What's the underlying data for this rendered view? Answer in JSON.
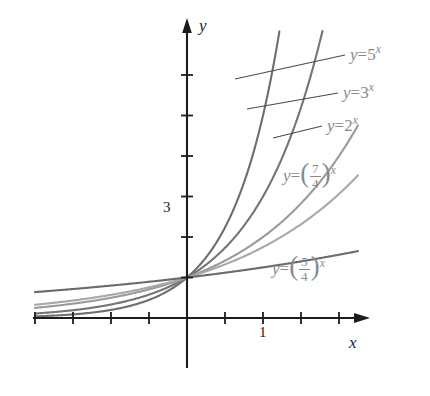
{
  "chart_data": {
    "type": "line",
    "title": "",
    "xlabel": "x",
    "ylabel": "y",
    "xlim": [
      -2.0,
      2.35
    ],
    "ylim": [
      -0.45,
      7.3
    ],
    "grid": false,
    "legend_position": "inline-labels",
    "x_tick_labels": [
      {
        "value": 1,
        "text": "1"
      }
    ],
    "y_tick_labels": [
      {
        "value": 3,
        "text": "3"
      }
    ],
    "x_ticks": [
      -2.0,
      -1.5,
      -1.0,
      -0.5,
      0,
      0.5,
      1.0,
      1.5,
      2.0
    ],
    "y_ticks": [
      0,
      1,
      2,
      3,
      4,
      5,
      6
    ],
    "note_common_point": "all curves pass through (0, 1)",
    "series": [
      {
        "name": "y = 5^x",
        "label_text": "y = 5",
        "base": 5,
        "color": "#6e6e6e",
        "points_x": [
          -2.0,
          -1.5,
          -1.0,
          -0.5,
          0,
          0.25,
          0.5,
          0.75,
          1.0,
          1.15
        ],
        "points_y": [
          0.04,
          0.089,
          0.2,
          0.447,
          1.0,
          1.495,
          2.236,
          3.344,
          5.0,
          6.9
        ]
      },
      {
        "name": "y = 3^x",
        "label_text": "y = 3",
        "base": 3,
        "color": "#757575",
        "points_x": [
          -2.0,
          -1.5,
          -1.0,
          -0.5,
          0,
          0.5,
          1.0,
          1.5,
          1.75
        ],
        "points_y": [
          0.111,
          0.192,
          0.333,
          0.577,
          1.0,
          1.732,
          3.0,
          5.196,
          6.84
        ]
      },
      {
        "name": "y = 2^x",
        "label_text": "y = 2",
        "base": 2,
        "color": "#9a9a9a",
        "points_x": [
          -2.0,
          -1.5,
          -1.0,
          -0.5,
          0,
          0.5,
          1.0,
          1.5,
          2.0,
          2.78
        ],
        "points_y": [
          0.25,
          0.354,
          0.5,
          0.707,
          1.0,
          1.414,
          2.0,
          2.828,
          4.0,
          6.87
        ]
      },
      {
        "name": "y = (7/4)^x",
        "label_numerator": "7",
        "label_denominator": "4",
        "base": 1.75,
        "color": "#a8a8a8",
        "points_x": [
          -2.0,
          -1.5,
          -1.0,
          -0.5,
          0,
          0.5,
          1.0,
          1.5,
          2.0,
          2.5,
          3.44
        ],
        "points_y": [
          0.327,
          0.432,
          0.571,
          0.756,
          1.0,
          1.323,
          1.75,
          2.315,
          3.063,
          4.051,
          6.85
        ]
      },
      {
        "name": "y = (5/4)^x",
        "label_numerator": "5",
        "label_denominator": "4",
        "base": 1.25,
        "color": "#6b6b6b",
        "points_x": [
          -2.0,
          -1.5,
          -1.0,
          -0.5,
          0,
          0.5,
          1.0,
          1.5,
          2.0,
          2.2
        ],
        "points_y": [
          0.64,
          0.716,
          0.8,
          0.894,
          1.0,
          1.118,
          1.25,
          1.398,
          1.5625,
          1.625
        ]
      }
    ],
    "annotations": [
      {
        "id": "label-5x",
        "text": "y = 5",
        "exponent": "x",
        "leader": true
      },
      {
        "id": "label-3x",
        "text": "y = 3",
        "exponent": "x",
        "leader": true
      },
      {
        "id": "label-2x",
        "text": "y = 2",
        "exponent": "x",
        "leader": true
      },
      {
        "id": "label-74x",
        "text": "y =",
        "exponent": "x",
        "leader": false
      },
      {
        "id": "label-54x",
        "text": "y =",
        "exponent": "x",
        "leader": false
      }
    ]
  },
  "axes": {
    "y_axis_name": "y",
    "x_axis_name": "x",
    "y_tick_3": "3",
    "x_tick_1": "1"
  },
  "labels": {
    "eq5": {
      "lhs": "y",
      "eq": "=",
      "base": "5",
      "exp": "x"
    },
    "eq3": {
      "lhs": "y",
      "eq": "=",
      "base": "3",
      "exp": "x"
    },
    "eq2": {
      "lhs": "y",
      "eq": "=",
      "base": "2",
      "exp": "x"
    },
    "eq74": {
      "lhs": "y",
      "eq": "=",
      "num": "7",
      "den": "4",
      "exp": "x"
    },
    "eq54": {
      "lhs": "y",
      "eq": "=",
      "num": "5",
      "den": "4",
      "exp": "x"
    }
  },
  "colors": {
    "axis": "#1c1c1c",
    "label_text": "#8a8a8a",
    "leader": "#4a4a4a",
    "background": "#ffffff"
  }
}
